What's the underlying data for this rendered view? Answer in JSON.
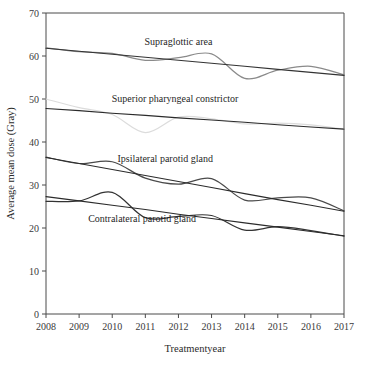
{
  "chart_data": {
    "type": "line",
    "title": "",
    "xlabel": "Treatmentyear",
    "ylabel": "Average mean dose (Gray)",
    "x": [
      2008,
      2009,
      2010,
      2011,
      2012,
      2013,
      2014,
      2015,
      2016,
      2017
    ],
    "xtick_labels": [
      "2008",
      "2009",
      "2010",
      "2011",
      "2012",
      "2013",
      "2014",
      "2015",
      "2016",
      "2017"
    ],
    "ytick_labels": [
      "0",
      "10",
      "20",
      "30",
      "40",
      "50",
      "60",
      "70"
    ],
    "yticks": [
      0,
      10,
      20,
      30,
      40,
      50,
      60,
      70
    ],
    "xlim": [
      2008,
      2017
    ],
    "ylim": [
      0,
      70
    ],
    "grid": false,
    "legend_position": "inline-annotations",
    "series": [
      {
        "name": "Supraglottic area",
        "color": "#8a8a8a",
        "kind": "smoothed",
        "values": [
          61.9,
          61.0,
          60.6,
          59.0,
          59.6,
          60.5,
          54.8,
          56.7,
          57.6,
          55.6
        ]
      },
      {
        "name": "Supraglottic area trend",
        "color": "#333333",
        "kind": "trend",
        "values": [
          61.8,
          61.1,
          60.4,
          59.7,
          59.0,
          58.3,
          57.6,
          56.9,
          56.2,
          55.5
        ]
      },
      {
        "name": "Superior pharyngeal constrictor",
        "color": "#dcdcdc",
        "kind": "smoothed",
        "values": [
          50.0,
          48.0,
          46.4,
          42.2,
          45.8,
          45.4,
          44.2,
          44.4,
          44.0,
          43.0
        ]
      },
      {
        "name": "Superior pharyngeal constrictor trend",
        "color": "#2b2b2b",
        "kind": "trend",
        "values": [
          47.8,
          47.3,
          46.7,
          46.2,
          45.6,
          45.1,
          44.6,
          44.0,
          43.5,
          43.0
        ]
      },
      {
        "name": "Ipsilateral parotid gland",
        "color": "#4a4a4a",
        "kind": "smoothed",
        "values": [
          36.5,
          35.0,
          35.4,
          31.6,
          30.2,
          31.5,
          26.5,
          27.0,
          27.0,
          24.0
        ]
      },
      {
        "name": "Ipsilateral parotid gland trend",
        "color": "#2b2b2b",
        "kind": "trend",
        "values": [
          36.4,
          35.0,
          33.6,
          32.2,
          30.8,
          29.4,
          28.0,
          26.6,
          25.3,
          23.9
        ]
      },
      {
        "name": "Contralateral parotid gland",
        "color": "#333333",
        "kind": "smoothed",
        "values": [
          26.2,
          26.3,
          28.3,
          22.4,
          22.7,
          22.9,
          19.5,
          20.3,
          19.4,
          18.1
        ]
      },
      {
        "name": "Contralateral parotid gland trend",
        "color": "#2b2b2b",
        "kind": "trend",
        "values": [
          27.3,
          26.3,
          25.3,
          24.3,
          23.2,
          22.2,
          21.2,
          20.2,
          19.2,
          18.2
        ]
      }
    ],
    "annotations": [
      {
        "text": "Supraglottic area",
        "x": 2012.0,
        "y": 62.5
      },
      {
        "text": "Superior pharyngeal constrictor",
        "x": 2011.9,
        "y": 49.3
      },
      {
        "text": "Ipsilateral parotid gland",
        "x": 2011.6,
        "y": 35.4
      },
      {
        "text": "Contralateral parotid gland",
        "x": 2010.9,
        "y": 21.3
      }
    ]
  },
  "axes": {
    "x_title": "Treatmentyear",
    "y_title": "Average mean dose (Gray)"
  }
}
